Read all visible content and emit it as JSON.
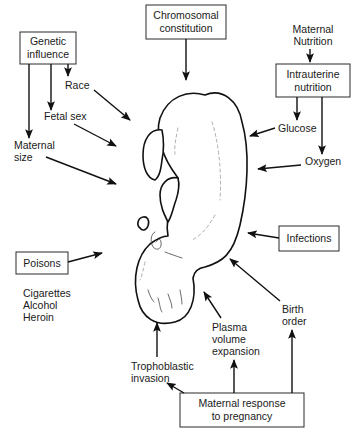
{
  "diagram": {
    "central_figure": "fetus",
    "boxes": {
      "genetic": [
        "Genetic",
        "influence"
      ],
      "chromosomal": [
        "Chromosomal",
        "constitution"
      ],
      "intrauterine": [
        "Intrauterine",
        "nutrition"
      ],
      "infections": [
        "Infections"
      ],
      "poisons": [
        "Poisons"
      ],
      "maternal_response": [
        "Maternal response",
        "to pregnancy"
      ]
    },
    "labels": {
      "maternal_nutrition": [
        "Maternal",
        "Nutrition"
      ],
      "race": [
        "Race"
      ],
      "fetal_sex": [
        "Fetal sex"
      ],
      "maternal_size": [
        "Maternal",
        "size"
      ],
      "glucose": [
        "Glucose"
      ],
      "oxygen": [
        "Oxygen"
      ],
      "poisons_list": [
        "Cigarettes",
        "Alcohol",
        "Heroin"
      ],
      "trophoblastic": [
        "Trophoblastic",
        "invasion"
      ],
      "plasma": [
        "Plasma",
        "volume",
        "expansion"
      ],
      "birth_order": [
        "Birth",
        "order"
      ]
    },
    "colors": {
      "background": "#ffffff",
      "ink": "#111111"
    }
  }
}
